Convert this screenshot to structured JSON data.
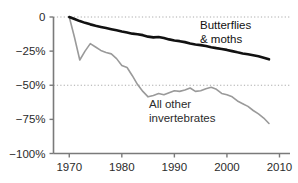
{
  "chart_data": {
    "type": "line",
    "title": "",
    "subtitle": "",
    "xlabel": "",
    "ylabel": "",
    "xlim": [
      1967,
      2012
    ],
    "ylim": [
      -100,
      0
    ],
    "xticks": [
      1970,
      1980,
      1990,
      2000,
      2010
    ],
    "xticklabels": [
      "1970",
      "1980",
      "1990",
      "2000",
      "2010"
    ],
    "yticks": [
      0,
      -25,
      -50,
      -75,
      -100
    ],
    "yticklabels": [
      "0",
      "−25%",
      "−50%",
      "−75%",
      "−100%"
    ],
    "grid": "horizontal dotted at 0% and -50%",
    "legend_position": "inline annotations on plot",
    "series": [
      {
        "name": "Butterflies & moths",
        "label_lines": [
          "Butterflies",
          "& moths"
        ],
        "color": "#111111",
        "linewidth": 2.6,
        "x": [
          1970,
          1971,
          1972,
          1973,
          1974,
          1975,
          1976,
          1977,
          1978,
          1979,
          1980,
          1981,
          1982,
          1983,
          1984,
          1985,
          1986,
          1987,
          1988,
          1989,
          1990,
          1991,
          1992,
          1993,
          1994,
          1995,
          1996,
          1997,
          1998,
          1999,
          2000,
          2001,
          2002,
          2003,
          2004,
          2005,
          2006,
          2007,
          2008
        ],
        "values": [
          0,
          -1.5,
          -3.0,
          -4.3,
          -5.4,
          -6.4,
          -7.3,
          -8.1,
          -8.9,
          -9.7,
          -10.6,
          -11.4,
          -12.2,
          -12.6,
          -13.3,
          -14.4,
          -14.9,
          -14.6,
          -15.4,
          -16.4,
          -17.2,
          -17.7,
          -18.4,
          -19.4,
          -20.1,
          -20.6,
          -21.3,
          -22.1,
          -22.8,
          -23.4,
          -24.1,
          -25.0,
          -25.9,
          -26.7,
          -27.3,
          -28.0,
          -28.7,
          -29.8,
          -31.0
        ]
      },
      {
        "name": "All other invertebrates",
        "label_lines": [
          "All other",
          "invertebrates"
        ],
        "color": "#9a9a9a",
        "linewidth": 1.6,
        "x": [
          1970,
          1971,
          1972,
          1973,
          1974,
          1975,
          1976,
          1977,
          1978,
          1979,
          1980,
          1981,
          1982,
          1983,
          1984,
          1985,
          1986,
          1987,
          1988,
          1989,
          1990,
          1991,
          1992,
          1993,
          1994,
          1995,
          1996,
          1997,
          1998,
          1999,
          2000,
          2001,
          2002,
          2003,
          2004,
          2005,
          2006,
          2007,
          2008
        ],
        "values": [
          0,
          -15.0,
          -31.5,
          -25.0,
          -19.5,
          -22.0,
          -24.5,
          -26.0,
          -27.0,
          -30.5,
          -35.5,
          -37.0,
          -43.0,
          -49.5,
          -54.5,
          -58.5,
          -57.5,
          -56.0,
          -57.0,
          -55.5,
          -54.0,
          -54.5,
          -53.5,
          -52.0,
          -54.5,
          -54.0,
          -52.5,
          -51.5,
          -53.0,
          -56.0,
          -57.0,
          -58.5,
          -61.5,
          -63.5,
          -65.5,
          -68.5,
          -71.0,
          -74.0,
          -78.0
        ]
      }
    ]
  },
  "annotations": {
    "butterflies": {
      "line1": "Butterflies",
      "line2": "& moths"
    },
    "invertebrates": {
      "line1": "All other",
      "line2": "invertebrates"
    }
  },
  "colors": {
    "butterflies": "#111111",
    "invertebrates": "#9a9a9a",
    "axis": "#7a7a7a",
    "grid": "#aaaaaa",
    "text": "#2b2b2b",
    "background": "#ffffff"
  }
}
